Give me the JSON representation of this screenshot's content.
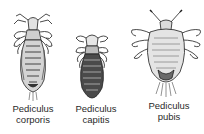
{
  "diagram": {
    "type": "labeled-illustration",
    "specimens": [
      {
        "id": "corporis",
        "label_line1": "Pediculus",
        "label_line2": "corporis"
      },
      {
        "id": "capitis",
        "label_line1": "Pediculus",
        "label_line2": "capitis"
      },
      {
        "id": "pubis",
        "label_line1": "Pediculus",
        "label_line2": "pubis"
      }
    ]
  },
  "colors": {
    "ink": "#1e1e1e",
    "shade": "#8a8a8a",
    "light": "#d8d8d8",
    "background": "#ffffff"
  }
}
